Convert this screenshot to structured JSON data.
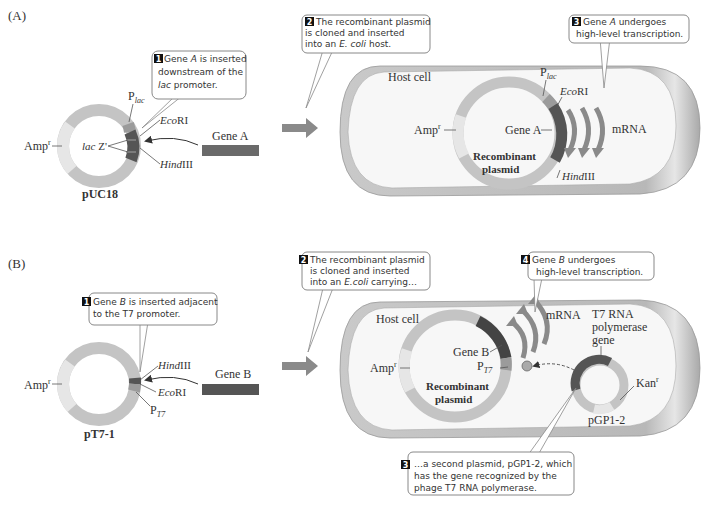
{
  "panelA": {
    "label": "(A)",
    "plasmid_name": "pUC18",
    "amp": "Amp",
    "amp_sup": "r",
    "plac_P": "P",
    "plac_sub": "lac",
    "ecori_it": "Eco",
    "ecori_rest": "RI",
    "hind_it": "Hind",
    "hind_rest": "III",
    "lacz_it": "lac",
    "lacz_rest": " Z'",
    "gene": "Gene A",
    "step1": {
      "num": "1",
      "l1a": "Gene ",
      "l1i": "A",
      "l1b": " is inserted",
      "l2": "downstream of the",
      "l3i": "lac",
      "l3b": " promoter."
    },
    "step2": {
      "num": "2",
      "l1": "The recombinant plasmid",
      "l2": "is cloned and inserted",
      "l3a": "into an ",
      "l3i": "E. coli",
      "l3b": " host."
    },
    "step3": {
      "num": "3",
      "l1a": "Gene ",
      "l1i": "A",
      "l1b": " undergoes",
      "l2": "high-level transcription."
    },
    "host_cell": "Host cell",
    "rec1": "Recombinant",
    "rec2": "plasmid",
    "mrna": "mRNA"
  },
  "panelB": {
    "label": "(B)",
    "plasmid_name": "pT7-1",
    "amp": "Amp",
    "amp_sup": "r",
    "pt7_P": "P",
    "pt7_sub": "T7",
    "ecori_it": "Eco",
    "ecori_rest": "RI",
    "hind_it": "Hind",
    "hind_rest": "III",
    "gene": "Gene B",
    "step1": {
      "num": "1",
      "l1a": "Gene ",
      "l1i": "B",
      "l1b": " is inserted adjacent",
      "l2": "to the T7 promoter."
    },
    "step2": {
      "num": "2",
      "l1": "The recombinant plasmid",
      "l2": "is cloned and inserted",
      "l3a": "into an ",
      "l3i": "E.coli",
      "l3b": "  carrying…"
    },
    "step3": {
      "num": "3",
      "l1": "…a second plasmid, pGP1-2, which",
      "l2": "has the gene recognized by the",
      "l3": "phage T7 RNA polymerase."
    },
    "step4": {
      "num": "4",
      "l1a": "Gene ",
      "l1i": "B",
      "l1b": " undergoes",
      "l2": "high-level transcription."
    },
    "host_cell": "Host cell",
    "rec1": "Recombinant",
    "rec2": "plasmid",
    "mrna": "mRNA",
    "t7_1": "T7 RNA",
    "t7_2": "polymerase",
    "t7_3": "gene",
    "kan": "Kan",
    "kan_sup": "r",
    "pgp": "pGP1-2"
  },
  "colors": {
    "ring_light": "#d6d6d6",
    "ring_mid": "#b9b9b9",
    "ring_pale": "#e8e8e8",
    "gene_dark": "#555555",
    "gene_bar": "#6a6a6a",
    "arrow_gray": "#8a8a8a",
    "cell_fill": "#f6f6f6",
    "cell_rim": "#bdbdbd"
  }
}
